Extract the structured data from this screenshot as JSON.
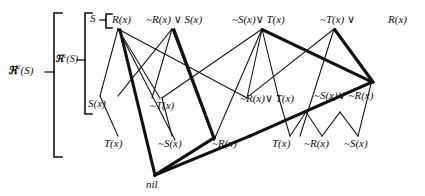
{
  "figure": {
    "type": "resolution-refutation-tree",
    "background_color": "#fdfdfd",
    "line_color": "#111111",
    "nil_label": "nil"
  },
  "brackets": {
    "outer": {
      "label_prefix": "ℜ",
      "label_sup": "2",
      "label_suffix": "(S)"
    },
    "inner": {
      "label_prefix": "ℜ",
      "label_sup": "1",
      "label_suffix": "(S)"
    },
    "set": {
      "label": "S"
    }
  },
  "rows": {
    "top": [
      {
        "id": "n_rx",
        "text": "R(x)"
      },
      {
        "id": "n_nrx_v_sx",
        "text": "~R(x) ∨ S(x)"
      },
      {
        "id": "n_nsx_v_tx",
        "text": "~S(x)∨ T(x)"
      },
      {
        "id": "n_ntx_v",
        "text": "~T(x) ∨"
      },
      {
        "id": "n_rx2",
        "text": "R(x)"
      }
    ],
    "middle": [
      {
        "id": "m_sx",
        "text": "S(x)"
      },
      {
        "id": "m_ntx",
        "text": "~T(x)"
      },
      {
        "id": "m_nrx_v_tx",
        "text": "~R(x)∨ T(x)"
      },
      {
        "id": "m_nsx_v_nrx",
        "text": "~S(x)∨ ~R(x)"
      }
    ],
    "bottom": [
      {
        "id": "b_tx",
        "text": "T(x)"
      },
      {
        "id": "b_nsx",
        "text": "~S(x)"
      },
      {
        "id": "b_nrx",
        "text": "~R(x)"
      },
      {
        "id": "b_tx2",
        "text": "T(x)"
      },
      {
        "id": "b_nrx2",
        "text": "~R(x)"
      },
      {
        "id": "b_nsx2",
        "text": "~S(x)"
      }
    ],
    "terminal": [
      {
        "id": "t_nil",
        "text": "nil"
      }
    ]
  },
  "edges": {
    "thin_count": 22,
    "thick_count": 7
  }
}
